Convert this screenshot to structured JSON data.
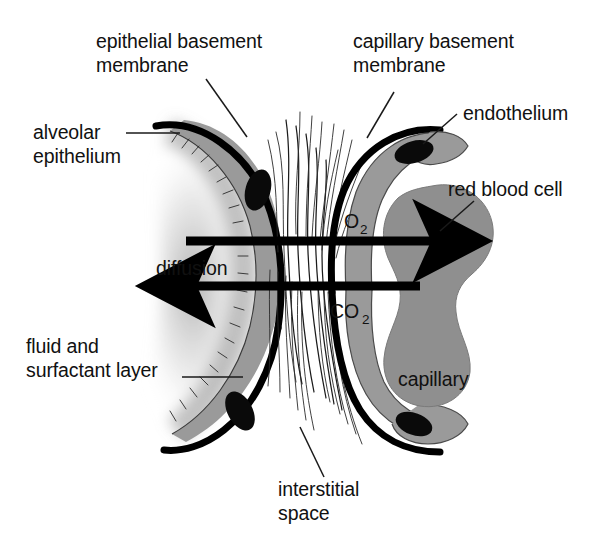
{
  "figure": {
    "background_color": "#ffffff",
    "ink_color": "#111111",
    "cell_fill_color": "#9a9a9a",
    "rbc_fill_color": "#8f8f8f",
    "membrane_color": "#000000",
    "nucleus_color": "#0a0a0a"
  },
  "labels": {
    "epithelial_basement_membrane_line1": "epithelial basement",
    "epithelial_basement_membrane_line2": "membrane",
    "capillary_basement_membrane_line1": "capillary basement",
    "capillary_basement_membrane_line2": "membrane",
    "endothelium": "endothelium",
    "alveolar_epithelium_line1": "alveolar",
    "alveolar_epithelium_line2": "epithelium",
    "red_blood_cell": "red blood cell",
    "diffusion": "diffusion",
    "capillary": "capillary",
    "fluid_surfactant_line1": "fluid and",
    "fluid_surfactant_line2": "surfactant layer",
    "interstitial_space_line1": "interstitial",
    "interstitial_space_line2": "space"
  },
  "gases": {
    "oxygen_symbol": "O",
    "oxygen_subscript": "2",
    "carbon_dioxide_symbol": "CO",
    "carbon_dioxide_subscript": "2"
  },
  "arrows": [
    {
      "name": "oxygen-diffusion-arrow",
      "gas": "O2",
      "direction": "right",
      "description": "O2 diffuses from alveolus into capillary toward red blood cell",
      "x_start": 186,
      "x_end": 440,
      "y": 241
    },
    {
      "name": "carbon-dioxide-diffusion-arrow",
      "gas": "CO2",
      "direction": "left",
      "description": "CO2 diffuses from capillary blood into alveolus",
      "x_start": 420,
      "x_end": 188,
      "y": 286
    }
  ],
  "structures": [
    {
      "name": "alveolar-epithelium",
      "side": "left"
    },
    {
      "name": "epithelial-basement-membrane",
      "side": "left"
    },
    {
      "name": "fluid-and-surfactant-layer",
      "side": "left"
    },
    {
      "name": "interstitial-space",
      "side": "center"
    },
    {
      "name": "capillary-basement-membrane",
      "side": "right"
    },
    {
      "name": "capillary-endothelium",
      "side": "right"
    },
    {
      "name": "red-blood-cell",
      "side": "right"
    },
    {
      "name": "capillary-lumen",
      "side": "right"
    }
  ]
}
